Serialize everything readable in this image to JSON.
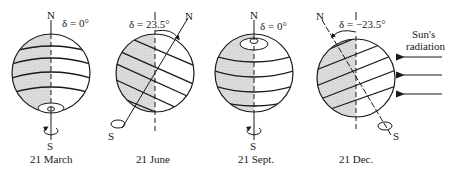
{
  "figure": {
    "globes": [
      {
        "id": "march",
        "caption": "21 March",
        "declination_label": "δ = 0°",
        "north_label": "N",
        "south_label": "S",
        "tilt_deg": 0
      },
      {
        "id": "june",
        "caption": "21 June",
        "declination_label": "δ = 23.5°",
        "north_label": "N",
        "south_label": "S",
        "tilt_deg": 23.5
      },
      {
        "id": "sept",
        "caption": "21 Sept.",
        "declination_label": "δ = 0°",
        "north_label": "N",
        "south_label": "S",
        "tilt_deg": 0
      },
      {
        "id": "dec",
        "caption": "21 Dec.",
        "declination_label": "δ = −23.5°",
        "north_label": "N",
        "south_label": "S",
        "tilt_deg": -23.5
      }
    ],
    "sun": {
      "label_line1": "Sun's",
      "label_line2": "radiation",
      "arrow_count": 3
    },
    "colors": {
      "ink": "#1a1a1a",
      "shade": "#d6d6d6",
      "background": "#ffffff"
    }
  }
}
